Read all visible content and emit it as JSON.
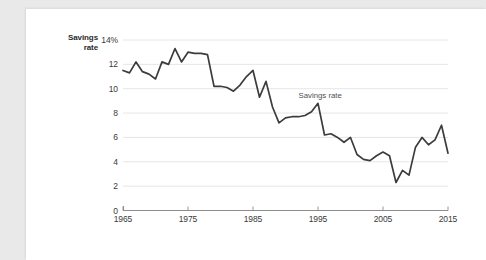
{
  "figure": {
    "background_color": "#e9e9e9",
    "card_color": "#ffffff",
    "line_color": "#3c3c3c",
    "grid_color": "#e3e3e3",
    "axis_color": "#8d8d8d",
    "axis_label_y_line1": "Savings",
    "axis_label_y_line2": "rate",
    "annotation": "Savings rate"
  },
  "chart_data": {
    "type": "line",
    "title": "",
    "subtitle": "",
    "xlabel": "",
    "ylabel": "Savings rate",
    "xlim": [
      1965,
      2015
    ],
    "ylim": [
      0,
      14
    ],
    "grid": true,
    "legend_position": "inline-annotation",
    "ytick_labels": [
      "14%",
      "12",
      "10",
      "8",
      "6",
      "4",
      "2",
      "0"
    ],
    "ytick_values": [
      14,
      12,
      10,
      8,
      6,
      4,
      2,
      0
    ],
    "xtick_labels": [
      "1965",
      "1975",
      "1985",
      "1995",
      "2005",
      "2015"
    ],
    "xtick_values": [
      1965,
      1975,
      1985,
      1995,
      2005,
      2015
    ],
    "annotations": [
      {
        "text": "Savings rate",
        "x": 1994,
        "y": 9.4
      }
    ],
    "series": [
      {
        "name": "Savings rate",
        "color": "#3c3c3c",
        "x": [
          1965,
          1966,
          1967,
          1968,
          1969,
          1970,
          1971,
          1972,
          1973,
          1974,
          1975,
          1976,
          1977,
          1978,
          1979,
          1980,
          1981,
          1982,
          1983,
          1984,
          1985,
          1986,
          1987,
          1988,
          1989,
          1990,
          1991,
          1992,
          1993,
          1994,
          1995,
          1996,
          1997,
          1998,
          1999,
          2000,
          2001,
          2002,
          2003,
          2004,
          2005,
          2006,
          2007,
          2008,
          2009,
          2010,
          2011,
          2012,
          2013,
          2014,
          2015
        ],
        "values": [
          11.5,
          11.3,
          12.2,
          11.4,
          11.2,
          10.8,
          12.2,
          12.0,
          13.3,
          12.2,
          13.0,
          12.9,
          12.9,
          12.8,
          10.2,
          10.2,
          10.1,
          9.8,
          10.3,
          11.0,
          11.5,
          9.3,
          10.6,
          8.5,
          7.2,
          7.6,
          7.7,
          7.7,
          7.8,
          8.1,
          8.8,
          6.2,
          6.3,
          6.0,
          5.6,
          6.0,
          4.6,
          4.2,
          4.1,
          4.5,
          4.8,
          4.5,
          2.3,
          3.3,
          2.9,
          5.2,
          6.0,
          5.4,
          5.8,
          7.0,
          4.7
        ]
      }
    ]
  }
}
